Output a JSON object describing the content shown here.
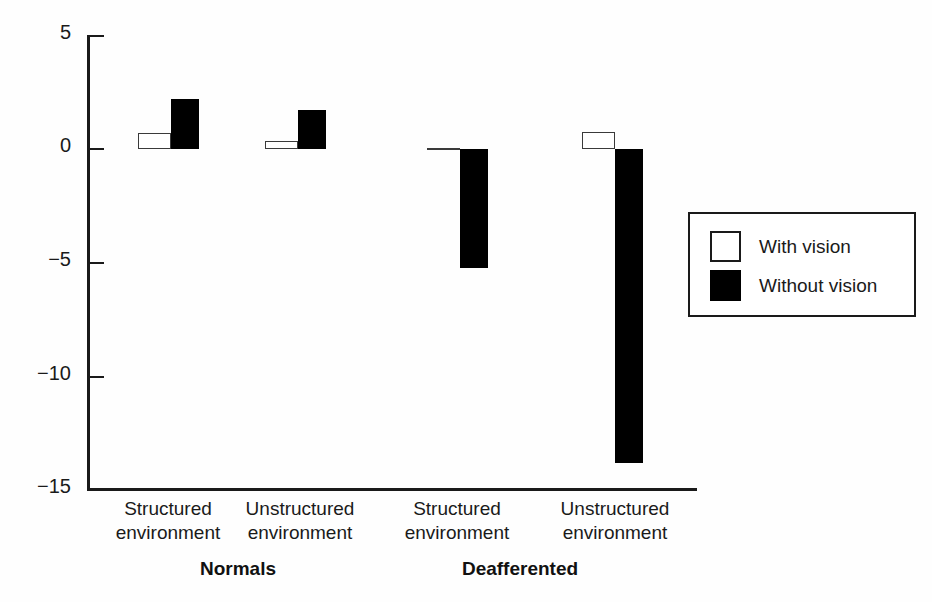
{
  "chart_data": {
    "type": "bar",
    "title": "",
    "subtitle": "",
    "xlabel": "",
    "ylabel": "",
    "ylim": [
      -15,
      5
    ],
    "yticks": [
      5,
      0,
      -5,
      -10,
      -15
    ],
    "ytick_labels": [
      "5",
      "0",
      "−5",
      "−10",
      "−15"
    ],
    "grid": false,
    "legend_position": "right",
    "categories": [
      "Structured environment",
      "Unstructured environment",
      "Structured environment",
      "Unstructured environment"
    ],
    "category_lines": [
      {
        "line1": "Structured",
        "line2": "environment"
      },
      {
        "line1": "Unstructured",
        "line2": "environment"
      },
      {
        "line1": "Structured",
        "line2": "environment"
      },
      {
        "line1": "Unstructured",
        "line2": "environment"
      }
    ],
    "groups": [
      {
        "label": "Normals",
        "categories": [
          0,
          1
        ]
      },
      {
        "label": "Deafferented",
        "categories": [
          2,
          3
        ]
      }
    ],
    "series": [
      {
        "name": "With vision",
        "color": "#ffffff",
        "edge_color": "#3a3a3a",
        "values": [
          0.7,
          0.35,
          0.05,
          0.75
        ]
      },
      {
        "name": "Without vision",
        "color": "#000000",
        "edge_color": "#000000",
        "values": [
          2.2,
          1.7,
          -5.25,
          -13.8
        ]
      }
    ],
    "legend_entries": [
      {
        "label": "With vision",
        "swatch": "light"
      },
      {
        "label": "Without vision",
        "swatch": "dark"
      }
    ],
    "axis_color": "#1a1a1a",
    "background": "#fefefe"
  }
}
